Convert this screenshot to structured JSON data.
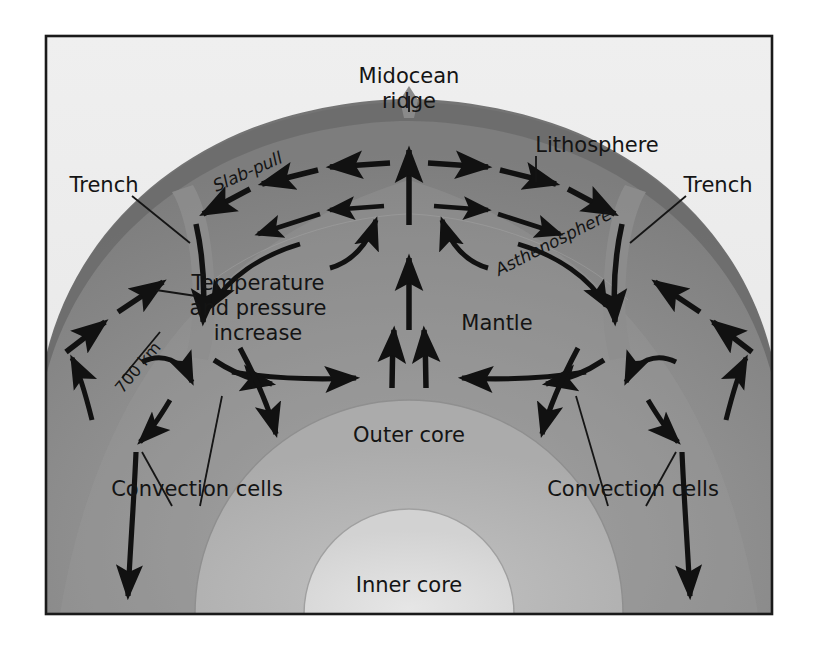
{
  "figure": {
    "frame": {
      "border_color": "#1a1a1a",
      "background_color": "#ececec"
    },
    "layers": [
      {
        "name": "lithosphere",
        "label": "Lithosphere",
        "color": "#6f6f6f"
      },
      {
        "name": "asthenosphere",
        "label": "Asthenosphere",
        "color": "#9a9a9a"
      },
      {
        "name": "mantle",
        "label": "Mantle",
        "color": "#8e8e8e"
      },
      {
        "name": "outer-core",
        "label": "Outer core",
        "color": "#b4b4b4"
      },
      {
        "name": "inner-core",
        "label": "Inner core",
        "color": "#dcdcdc"
      }
    ],
    "labels": {
      "midocean_ridge_line1": "Midocean",
      "midocean_ridge_line2": "ridge",
      "lithosphere": "Lithosphere",
      "asthenosphere": "Asthenosphere",
      "mantle": "Mantle",
      "outer_core": "Outer core",
      "inner_core": "Inner core",
      "trench_left": "Trench",
      "trench_right": "Trench",
      "slab_pull": "Slab-pull",
      "depth_700km": "700 km",
      "temp_line1": "Temperature",
      "temp_line2": "and pressure",
      "temp_line3": "increase",
      "convection_left": "Convection cells",
      "convection_right": "Convection cells"
    },
    "arrow_color": "#111111",
    "leader_color": "#151515"
  }
}
